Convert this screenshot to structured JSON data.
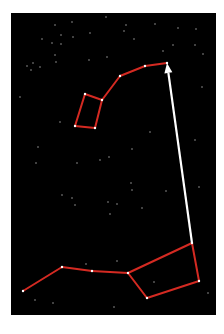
{
  "diagram": {
    "title": "",
    "background_color": "#000000",
    "page_color": "#ffffff",
    "line_color": "#d42a22",
    "star_color": "#ffffff",
    "arrow_color": "#ffffff",
    "panel": {
      "x": 11,
      "y": 13,
      "width": 205,
      "height": 302
    },
    "constellations": [
      {
        "name": "little-dipper",
        "stars": [
          {
            "id": "polaris",
            "x": 167,
            "y": 63
          },
          {
            "id": "ld-2",
            "x": 145,
            "y": 66
          },
          {
            "id": "ld-3",
            "x": 120,
            "y": 76
          },
          {
            "id": "ld-4",
            "x": 102,
            "y": 100
          },
          {
            "id": "ld-5",
            "x": 85,
            "y": 94
          },
          {
            "id": "ld-6",
            "x": 75,
            "y": 126
          },
          {
            "id": "ld-7",
            "x": 95,
            "y": 128
          }
        ],
        "edges": [
          [
            "polaris",
            "ld-2"
          ],
          [
            "ld-2",
            "ld-3"
          ],
          [
            "ld-3",
            "ld-4"
          ],
          [
            "ld-4",
            "ld-5"
          ],
          [
            "ld-5",
            "ld-6"
          ],
          [
            "ld-6",
            "ld-7"
          ],
          [
            "ld-7",
            "ld-4"
          ]
        ]
      },
      {
        "name": "big-dipper",
        "stars": [
          {
            "id": "bd-handle-end",
            "x": 23,
            "y": 291
          },
          {
            "id": "bd-handle-2",
            "x": 62,
            "y": 267
          },
          {
            "id": "bd-handle-3",
            "x": 92,
            "y": 271
          },
          {
            "id": "bd-bowl-1",
            "x": 128,
            "y": 273
          },
          {
            "id": "bd-bowl-2",
            "x": 147,
            "y": 298
          },
          {
            "id": "bd-merak",
            "x": 199,
            "y": 281
          },
          {
            "id": "bd-dubhe",
            "x": 192,
            "y": 243
          }
        ],
        "edges": [
          [
            "bd-handle-end",
            "bd-handle-2"
          ],
          [
            "bd-handle-2",
            "bd-handle-3"
          ],
          [
            "bd-handle-3",
            "bd-bowl-1"
          ],
          [
            "bd-bowl-1",
            "bd-bowl-2"
          ],
          [
            "bd-bowl-2",
            "bd-merak"
          ],
          [
            "bd-merak",
            "bd-dubhe"
          ],
          [
            "bd-dubhe",
            "bd-bowl-1"
          ]
        ]
      }
    ],
    "pointer_arrow": {
      "from": {
        "x": 192,
        "y": 243
      },
      "to": {
        "x": 167,
        "y": 63
      },
      "label": ""
    },
    "background_stars": [
      {
        "x": 72,
        "y": 22
      },
      {
        "x": 106,
        "y": 17
      },
      {
        "x": 155,
        "y": 24
      },
      {
        "x": 126,
        "y": 25
      },
      {
        "x": 55,
        "y": 25
      },
      {
        "x": 178,
        "y": 28
      },
      {
        "x": 124,
        "y": 31
      },
      {
        "x": 196,
        "y": 29
      },
      {
        "x": 42,
        "y": 39
      },
      {
        "x": 61,
        "y": 35
      },
      {
        "x": 73,
        "y": 37
      },
      {
        "x": 90,
        "y": 33
      },
      {
        "x": 134,
        "y": 39
      },
      {
        "x": 52,
        "y": 43
      },
      {
        "x": 61,
        "y": 44
      },
      {
        "x": 195,
        "y": 45
      },
      {
        "x": 173,
        "y": 45
      },
      {
        "x": 55,
        "y": 55
      },
      {
        "x": 56,
        "y": 62
      },
      {
        "x": 89,
        "y": 60
      },
      {
        "x": 107,
        "y": 57
      },
      {
        "x": 163,
        "y": 51
      },
      {
        "x": 27,
        "y": 66
      },
      {
        "x": 33,
        "y": 63
      },
      {
        "x": 40,
        "y": 67
      },
      {
        "x": 31,
        "y": 70
      },
      {
        "x": 203,
        "y": 54
      },
      {
        "x": 202,
        "y": 87
      },
      {
        "x": 20,
        "y": 97
      },
      {
        "x": 60,
        "y": 122
      },
      {
        "x": 38,
        "y": 147
      },
      {
        "x": 36,
        "y": 163
      },
      {
        "x": 77,
        "y": 163
      },
      {
        "x": 100,
        "y": 160
      },
      {
        "x": 109,
        "y": 157
      },
      {
        "x": 132,
        "y": 149
      },
      {
        "x": 150,
        "y": 132
      },
      {
        "x": 195,
        "y": 140
      },
      {
        "x": 131,
        "y": 183
      },
      {
        "x": 132,
        "y": 190
      },
      {
        "x": 166,
        "y": 191
      },
      {
        "x": 62,
        "y": 195
      },
      {
        "x": 72,
        "y": 198
      },
      {
        "x": 108,
        "y": 202
      },
      {
        "x": 117,
        "y": 204
      },
      {
        "x": 199,
        "y": 187
      },
      {
        "x": 75,
        "y": 205
      },
      {
        "x": 110,
        "y": 214
      },
      {
        "x": 142,
        "y": 208
      },
      {
        "x": 208,
        "y": 293
      },
      {
        "x": 35,
        "y": 300
      },
      {
        "x": 53,
        "y": 303
      },
      {
        "x": 114,
        "y": 307
      },
      {
        "x": 86,
        "y": 264
      },
      {
        "x": 117,
        "y": 261
      },
      {
        "x": 154,
        "y": 282
      }
    ]
  }
}
